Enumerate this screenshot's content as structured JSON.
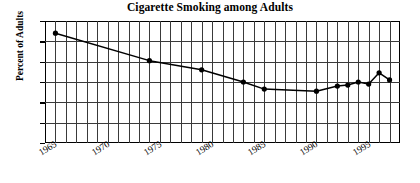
{
  "chart_data": {
    "type": "line",
    "title": "Cigarette Smoking among Adults",
    "xlabel": "",
    "ylabel": "Percent of Adults",
    "xlim": [
      1964,
      1998
    ],
    "ylim": [
      0,
      60
    ],
    "grid": true,
    "legend": "none",
    "y_ticks": [
      0,
      10,
      20,
      30,
      40,
      50,
      60
    ],
    "x_ticks": [
      1965,
      1970,
      1975,
      1980,
      1985,
      1990,
      1995
    ],
    "x_gridline_step": 1,
    "y_gridline_step": 10,
    "series": [
      {
        "name": "Percent of Adults",
        "marker": "filled-circle",
        "x": [
          1965,
          1974,
          1979,
          1983,
          1985,
          1990,
          1992,
          1993,
          1994,
          1995,
          1996,
          1997
        ],
        "values": [
          54,
          40.5,
          36,
          30,
          26.5,
          25.5,
          28,
          28.5,
          30,
          29,
          34.5,
          31
        ]
      }
    ]
  },
  "axis": {
    "y_tick_labels": [
      "60",
      "50",
      "40",
      "30",
      "20",
      "10",
      "0"
    ],
    "x_tick_labels": [
      "1965",
      "1970",
      "1975",
      "1980",
      "1985",
      "1990",
      "1995"
    ]
  }
}
